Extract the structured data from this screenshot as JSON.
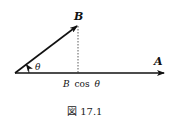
{
  "diagram": {
    "vectors": [
      {
        "name": "A",
        "label": "A",
        "from": [
          15,
          73
        ],
        "to": [
          165,
          73
        ]
      },
      {
        "name": "B",
        "label": "B",
        "from": [
          15,
          73
        ],
        "to": [
          78,
          25
        ]
      }
    ],
    "angle_label": "θ",
    "projection_label_prefix": "B",
    "projection_label_func": "cos",
    "projection_label_angle": "θ",
    "caption": "図 17.1"
  }
}
